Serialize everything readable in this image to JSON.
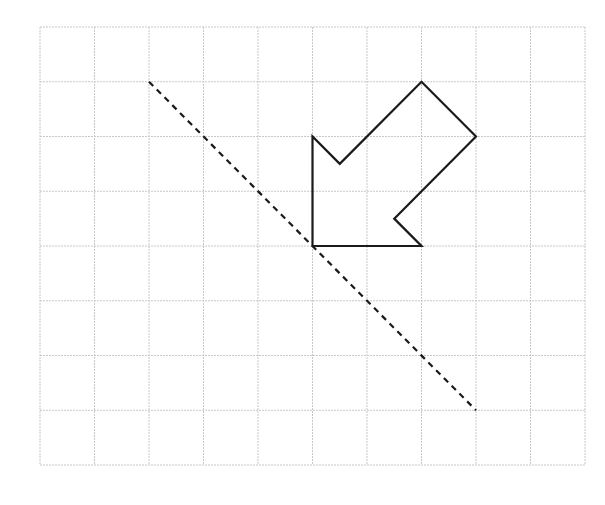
{
  "diagram": {
    "type": "grid-reflection",
    "grid": {
      "cols": 10,
      "rows": 8,
      "origin_px": [
        40,
        27
      ],
      "cell_w": 54.5,
      "cell_h": 54.75,
      "line_color": "#c8c8c8",
      "line_style": "dotted"
    },
    "shape": {
      "name": "arrow",
      "stroke": "#1a1a1a",
      "stroke_width": 2.2,
      "fill": "none",
      "vertices": [
        [
          5,
          4
        ],
        [
          7,
          4
        ],
        [
          6.5,
          3.5
        ],
        [
          8,
          2
        ],
        [
          7,
          1
        ],
        [
          5.5,
          2.5
        ],
        [
          5,
          2
        ]
      ]
    },
    "mirror_line": {
      "from": [
        2,
        1
      ],
      "to": [
        8,
        7
      ],
      "stroke": "#1a1a1a",
      "stroke_width": 2.2,
      "dash": "6,5"
    }
  }
}
